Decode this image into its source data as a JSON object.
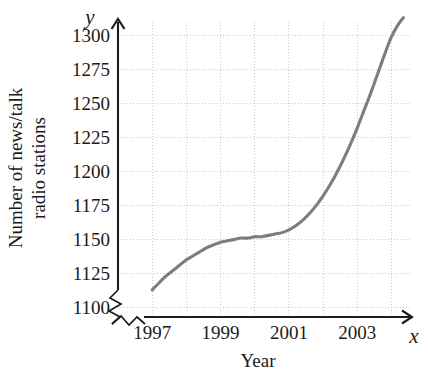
{
  "chart_data": {
    "type": "line",
    "title": "",
    "subtitle": "",
    "xlabel": "Year",
    "ylabel": "Number of news/talk radio stations",
    "ylabel_lines": [
      "Number of news/talk",
      "radio stations"
    ],
    "x_axis_symbol": "x",
    "y_axis_symbol": "y",
    "xlim": [
      1996,
      2004.6
    ],
    "ylim": [
      1093,
      1312
    ],
    "grid": true,
    "grid_style": "dotted",
    "legend": "none",
    "axis_break_x": true,
    "axis_break_y": true,
    "x_tick_labels": [
      "1997",
      "1999",
      "2001",
      "2003"
    ],
    "x_tick_values": [
      1997,
      1999,
      2001,
      2003
    ],
    "x_gridline_values": [
      1996,
      1997,
      1998,
      1999,
      2000,
      2001,
      2002,
      2003,
      2004
    ],
    "y_tick_labels": [
      "1100",
      "1125",
      "1150",
      "1175",
      "1200",
      "1225",
      "1250",
      "1275",
      "1300"
    ],
    "y_tick_values": [
      1100,
      1125,
      1150,
      1175,
      1200,
      1225,
      1250,
      1275,
      1300
    ],
    "series": [
      {
        "name": "News/talk radio stations",
        "color": "#7d7d7d",
        "x": [
          1997.0,
          1997.2,
          1997.4,
          1997.6,
          1997.8,
          1998.0,
          1998.2,
          1998.4,
          1998.6,
          1998.8,
          1999.0,
          1999.2,
          1999.4,
          1999.6,
          1999.8,
          2000.0,
          2000.2,
          2000.4,
          2000.6,
          2000.8,
          2001.0,
          2001.2,
          2001.4,
          2001.6,
          2001.8,
          2002.0,
          2002.2,
          2002.4,
          2002.6,
          2002.8,
          2003.0,
          2003.2,
          2003.4,
          2003.6,
          2003.8,
          2004.0,
          2004.2,
          2004.35
        ],
        "y": [
          1113,
          1118,
          1123,
          1127,
          1131,
          1135,
          1138,
          1141,
          1144,
          1146,
          1148,
          1149,
          1150,
          1151,
          1151,
          1152,
          1152,
          1153,
          1154,
          1155,
          1157,
          1160,
          1164,
          1169,
          1175,
          1182,
          1190,
          1199,
          1209,
          1220,
          1232,
          1245,
          1258,
          1272,
          1286,
          1299,
          1308,
          1313
        ]
      }
    ],
    "annotations": []
  },
  "axis": {
    "y_symbol": "y",
    "x_symbol": "x",
    "x_title": "Year",
    "y_title_line1": "Number of news/talk",
    "y_title_line2": "radio stations"
  },
  "colors": {
    "curve": "#7d7d7d",
    "axis": "#1b1b1b",
    "grid": "#c9c9c9",
    "background": "#ffffff",
    "text": "#1b1b1b"
  }
}
